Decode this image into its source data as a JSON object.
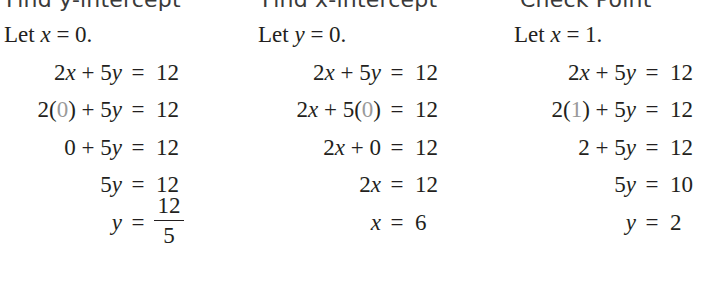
{
  "columns": [
    {
      "header": "Find y-intercept",
      "let": {
        "prefix": "Let ",
        "var": "x",
        "rest": " = 0."
      },
      "steps": [
        {
          "lhs": [
            {
              "t": "2"
            },
            {
              "t": "x",
              "v": 1
            },
            {
              "t": " + 5"
            },
            {
              "t": "y",
              "v": 1
            }
          ],
          "rhs": "12"
        },
        {
          "lhs": [
            {
              "t": "2("
            },
            {
              "t": "0",
              "s": 1
            },
            {
              "t": ") + 5"
            },
            {
              "t": "y",
              "v": 1
            }
          ],
          "rhs": "12"
        },
        {
          "lhs": [
            {
              "t": "0 + 5"
            },
            {
              "t": "y",
              "v": 1
            }
          ],
          "rhs": "12"
        },
        {
          "lhs": [
            {
              "t": "5"
            },
            {
              "t": "y",
              "v": 1
            }
          ],
          "rhs": "12"
        },
        {
          "lhs": [
            {
              "t": "y",
              "v": 1
            }
          ],
          "rhs_fraction": {
            "numerator": "12",
            "denominator": "5"
          }
        }
      ]
    },
    {
      "header": "Find x-intercept",
      "let": {
        "prefix": "Let ",
        "var": "y",
        "rest": " = 0."
      },
      "steps": [
        {
          "lhs": [
            {
              "t": "2"
            },
            {
              "t": "x",
              "v": 1
            },
            {
              "t": " + 5"
            },
            {
              "t": "y",
              "v": 1
            }
          ],
          "rhs": "12"
        },
        {
          "lhs": [
            {
              "t": "2"
            },
            {
              "t": "x",
              "v": 1
            },
            {
              "t": " + 5("
            },
            {
              "t": "0",
              "s": 1
            },
            {
              "t": ")"
            }
          ],
          "rhs": "12"
        },
        {
          "lhs": [
            {
              "t": "2"
            },
            {
              "t": "x",
              "v": 1
            },
            {
              "t": " + 0"
            }
          ],
          "rhs": "12"
        },
        {
          "lhs": [
            {
              "t": "2"
            },
            {
              "t": "x",
              "v": 1
            }
          ],
          "rhs": "12"
        },
        {
          "lhs": [
            {
              "t": "x",
              "v": 1
            }
          ],
          "rhs": "6"
        }
      ]
    },
    {
      "header": "Check Point",
      "let": {
        "prefix": "Let ",
        "var": "x",
        "rest": " = 1."
      },
      "steps": [
        {
          "lhs": [
            {
              "t": "2"
            },
            {
              "t": "x",
              "v": 1
            },
            {
              "t": " + 5"
            },
            {
              "t": "y",
              "v": 1
            }
          ],
          "rhs": "12"
        },
        {
          "lhs": [
            {
              "t": "2("
            },
            {
              "t": "1",
              "s": 1
            },
            {
              "t": ") + 5"
            },
            {
              "t": "y",
              "v": 1
            }
          ],
          "rhs": "12"
        },
        {
          "lhs": [
            {
              "t": "2 + 5"
            },
            {
              "t": "y",
              "v": 1
            }
          ],
          "rhs": "12"
        },
        {
          "lhs": [
            {
              "t": "5"
            },
            {
              "t": "y",
              "v": 1
            }
          ],
          "rhs": "10"
        },
        {
          "lhs": [
            {
              "t": "y",
              "v": 1
            }
          ],
          "rhs": "2"
        }
      ]
    }
  ],
  "equals_sign": "=",
  "colors": {
    "text": "#231f20",
    "substituted_value": "#9a9a9a",
    "header": "#3a3a3a"
  }
}
